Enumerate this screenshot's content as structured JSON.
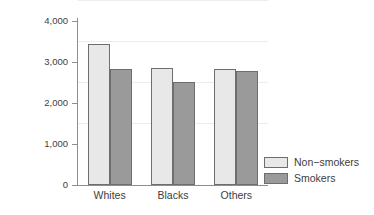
{
  "chart_data": {
    "type": "bar",
    "title": "",
    "subtitle": "",
    "xlabel": "",
    "ylabel": "Mean birthweight (grams)",
    "categories": [
      "Whites",
      "Blacks",
      "Others"
    ],
    "series": [
      {
        "name": "Non-smokers",
        "color": "#e8e8e8",
        "values": [
          3440,
          2860,
          2830
        ]
      },
      {
        "name": "Smokers",
        "color": "#9a9a9a",
        "values": [
          2830,
          2520,
          2780
        ]
      }
    ],
    "ylim": [
      0,
      4000
    ],
    "yticks": [
      0,
      1000,
      2000,
      3000,
      4000
    ],
    "ytick_labels": [
      "0",
      "1,000",
      "2,000",
      "3,000",
      "4,000"
    ],
    "grid": "horizontal",
    "legend_position": "bottom-right",
    "legend_entries": [
      "Non−smokers",
      "Smokers"
    ],
    "background_color": "#ffffff",
    "axis_color": "#8e8e8e",
    "grid_color": "#ededed",
    "bar_border_color": "#6e6e6e"
  }
}
